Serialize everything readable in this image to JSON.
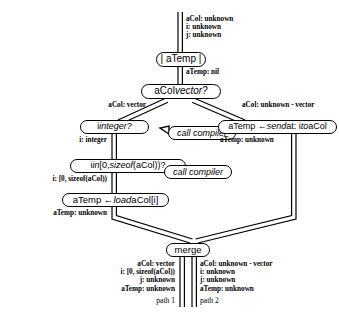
{
  "diagram": {
    "nodes": {
      "decl": {
        "text": "| aTemp |",
        "kind": "declaration"
      },
      "test_vec": {
        "pre": "aCol ",
        "em": "vector?",
        "kind": "decision"
      },
      "test_int": {
        "pre": "i ",
        "em": "integer?",
        "kind": "decision"
      },
      "test_range": {
        "pre": "i ",
        "em": "in",
        "post": " [0, ",
        "em2": "sizeof",
        "post2": "(aCol))?",
        "kind": "decision"
      },
      "load": {
        "pre": "aTemp ← ",
        "em": "load",
        "post": " aCol[i]",
        "kind": "operation"
      },
      "send": {
        "pre": "aTemp ← ",
        "em": "send",
        "post": " at: i ",
        "em2": "to",
        "post2": " aCol",
        "kind": "operation"
      },
      "compiler1": {
        "text": "call compiler",
        "kind": "bubble"
      },
      "compiler2": {
        "text": "call compiler",
        "kind": "bubble"
      },
      "merge": {
        "text": "merge",
        "kind": "merge"
      }
    },
    "annotations": {
      "entry": "aCol: unknown\ni: unknown\nj: unknown",
      "after_decl": "aTemp: nil",
      "branch_left": "aCol: vector",
      "branch_right": "aCol: unknown - vector",
      "after_int": "i: integer",
      "after_range": "i: [0, sizeof(aCol))",
      "after_load": "aTemp: unknown",
      "after_send": "aTemp: unknown",
      "merge_left": "aCol: vector\ni: [0, sizeof(aCol))\nj: unknown\naTemp: unknown",
      "merge_right": "aCol: unknown - vector\ni: unknown\nj: unknown\naTemp: unknown",
      "path1": "path 1",
      "path2": "path 2"
    },
    "colors": {
      "ink": "#000000",
      "paper": "#ffffff"
    }
  }
}
